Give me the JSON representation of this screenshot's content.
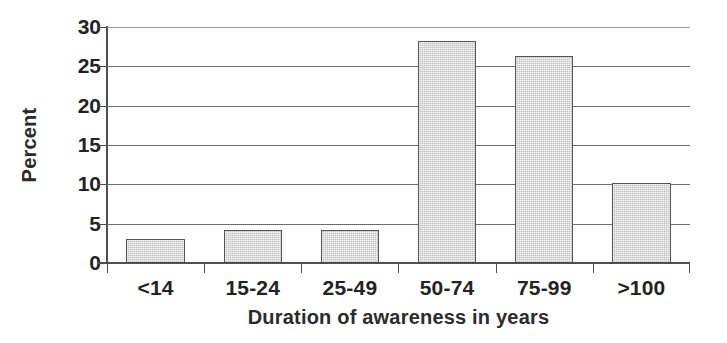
{
  "chart_data": {
    "type": "bar",
    "title": "",
    "subtitle": "",
    "xlabel": "Duration of awareness in years",
    "ylabel": "Percent",
    "categories": [
      "<14",
      "15-24",
      "25-49",
      "50-74",
      "75-99",
      ">100"
    ],
    "values": [
      3.1,
      4.2,
      4.2,
      28.2,
      26.3,
      10.2
    ],
    "series": [
      {
        "name": "Percent",
        "values": [
          3.1,
          4.2,
          4.2,
          28.2,
          26.3,
          10.2
        ]
      }
    ],
    "ylim": [
      0,
      30
    ],
    "xlim": null,
    "yticks": [
      0,
      5,
      10,
      15,
      20,
      25,
      30
    ],
    "ytick_labels": [
      "0",
      "5",
      "10",
      "15",
      "20",
      "25",
      "30"
    ],
    "grid": "horizontal",
    "legend": null,
    "legend_position": "none",
    "annotations": [],
    "bar_fill_color": "#c2c2c2",
    "bar_border_color": "#555555",
    "axis_color": "#4e4e4e",
    "gridline_color": "#6e6e6e",
    "text_color": "#232323",
    "background_color": "#ffffff"
  }
}
